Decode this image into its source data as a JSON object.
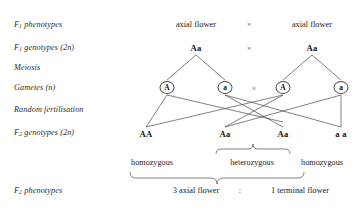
{
  "diagram": {
    "stage_labels": [
      {
        "prefix": "F",
        "sub": "1",
        "rest": " phenotypes"
      },
      {
        "prefix": "F",
        "sub": "1",
        "rest": " genotypes (2n)"
      },
      {
        "prefix": "",
        "sub": "",
        "rest": "Meiosis"
      },
      {
        "prefix": "",
        "sub": "",
        "rest": "Gametes (n)"
      },
      {
        "prefix": "",
        "sub": "",
        "rest": "Random fertilisation"
      },
      {
        "prefix": "F",
        "sub": "2",
        "rest": " genotypes (2n)"
      },
      {
        "prefix": "F",
        "sub": "2",
        "rest": " phenotypes"
      }
    ],
    "phenotypes_row": {
      "left": "axial flower",
      "operator": "×",
      "right": "axial flower"
    },
    "genotypes_row": {
      "left": "Aa",
      "operator": "×",
      "right": "Aa"
    },
    "gametes": [
      {
        "allele": "A"
      },
      {
        "allele": "a"
      },
      {
        "allele": "A"
      },
      {
        "allele": "a"
      }
    ],
    "gametes_operator": "×",
    "f2_genotypes": [
      "AA",
      "Aa",
      "Aa",
      "a a"
    ],
    "zygosity_labels": [
      "homozygous",
      "heterozygous",
      "homozygous"
    ],
    "f2_phenotype_ratio": {
      "left": "3 axial flower",
      "separator": ":",
      "right": "1 terminal flower"
    },
    "colors": {
      "ink": "#1a1a1a",
      "line": "#4a4a4a",
      "background": "#ffffff"
    }
  }
}
